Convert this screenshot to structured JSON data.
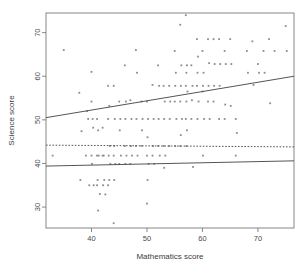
{
  "chart_data": {
    "type": "scatter",
    "title": "",
    "xlabel": "Mathematics score",
    "ylabel": "Science score",
    "xlim": [
      31.8,
      76.5
    ],
    "ylim": [
      25.2,
      74.5
    ],
    "xticks": [
      40,
      50,
      60,
      70
    ],
    "yticks": [
      30,
      40,
      50,
      60,
      70
    ],
    "grid": false,
    "legend": "none",
    "point_color": "#8c8c8c",
    "line_color": "#555555",
    "frame_color": "#7a7a7a",
    "points": [
      [
        35.0,
        66.0
      ],
      [
        33.0,
        41.8
      ],
      [
        37.8,
        56.2
      ],
      [
        38.2,
        47.4
      ],
      [
        38.0,
        36.2
      ],
      [
        39.0,
        41.8
      ],
      [
        39.4,
        50.2
      ],
      [
        39.2,
        52.0
      ],
      [
        39.6,
        35.0
      ],
      [
        40.0,
        61.0
      ],
      [
        40.2,
        50.2
      ],
      [
        40.3,
        48.2
      ],
      [
        40.0,
        41.8
      ],
      [
        40.1,
        39.9
      ],
      [
        40.4,
        35.0
      ],
      [
        40.0,
        54.2
      ],
      [
        41.0,
        50.2
      ],
      [
        41.2,
        47.6
      ],
      [
        41.0,
        41.8
      ],
      [
        41.3,
        41.8
      ],
      [
        41.1,
        36.2
      ],
      [
        41.0,
        35.0
      ],
      [
        41.2,
        29.2
      ],
      [
        41.5,
        33.0
      ],
      [
        42.0,
        48.2
      ],
      [
        42.2,
        41.8
      ],
      [
        42.0,
        41.8
      ],
      [
        42.3,
        36.2
      ],
      [
        42.1,
        35.0
      ],
      [
        42.5,
        32.9
      ],
      [
        43.0,
        57.8
      ],
      [
        43.2,
        53.2
      ],
      [
        43.0,
        50.2
      ],
      [
        43.3,
        44.0
      ],
      [
        43.1,
        41.8
      ],
      [
        43.4,
        39.9
      ],
      [
        43.2,
        36.2
      ],
      [
        43.0,
        35.0
      ],
      [
        44.0,
        57.8
      ],
      [
        44.2,
        50.2
      ],
      [
        44.1,
        44.0
      ],
      [
        44.0,
        41.8
      ],
      [
        44.3,
        39.9
      ],
      [
        44.1,
        36.2
      ],
      [
        44.0,
        26.3
      ],
      [
        45.0,
        54.2
      ],
      [
        45.2,
        50.2
      ],
      [
        45.1,
        47.6
      ],
      [
        45.3,
        41.8
      ],
      [
        45.0,
        39.9
      ],
      [
        46.0,
        62.5
      ],
      [
        46.2,
        54.2
      ],
      [
        46.1,
        50.2
      ],
      [
        46.0,
        44.0
      ],
      [
        46.3,
        41.8
      ],
      [
        46.1,
        39.9
      ],
      [
        47.0,
        54.5
      ],
      [
        47.2,
        50.2
      ],
      [
        47.1,
        44.0
      ],
      [
        47.3,
        41.8
      ],
      [
        47.0,
        39.9
      ],
      [
        48.0,
        66.0
      ],
      [
        48.2,
        60.8
      ],
      [
        48.1,
        50.2
      ],
      [
        48.0,
        44.0
      ],
      [
        48.3,
        41.8
      ],
      [
        49.0,
        54.2
      ],
      [
        49.2,
        50.2
      ],
      [
        49.1,
        47.6
      ],
      [
        49.0,
        44.0
      ],
      [
        50.0,
        54.2
      ],
      [
        50.2,
        50.2
      ],
      [
        50.1,
        46.0
      ],
      [
        50.0,
        41.8
      ],
      [
        50.3,
        39.9
      ],
      [
        50.1,
        36.2
      ],
      [
        50.0,
        30.8
      ],
      [
        51.0,
        58.0
      ],
      [
        51.2,
        50.2
      ],
      [
        51.1,
        44.0
      ],
      [
        51.0,
        41.8
      ],
      [
        51.3,
        39.9
      ],
      [
        52.0,
        62.5
      ],
      [
        52.2,
        57.8
      ],
      [
        52.1,
        50.2
      ],
      [
        52.0,
        44.0
      ],
      [
        52.3,
        41.8
      ],
      [
        53.0,
        57.8
      ],
      [
        53.2,
        54.2
      ],
      [
        53.1,
        50.2
      ],
      [
        53.0,
        44.0
      ],
      [
        53.3,
        41.8
      ],
      [
        53.1,
        39.0
      ],
      [
        54.0,
        57.8
      ],
      [
        54.2,
        54.2
      ],
      [
        54.1,
        50.2
      ],
      [
        54.0,
        44.0
      ],
      [
        55.0,
        65.8
      ],
      [
        55.2,
        60.8
      ],
      [
        55.1,
        57.8
      ],
      [
        55.0,
        54.2
      ],
      [
        55.3,
        50.2
      ],
      [
        55.1,
        44.0
      ],
      [
        56.0,
        71.8
      ],
      [
        56.2,
        62.5
      ],
      [
        56.1,
        57.8
      ],
      [
        56.0,
        54.2
      ],
      [
        56.3,
        50.2
      ],
      [
        56.1,
        46.5
      ],
      [
        56.0,
        44.0
      ],
      [
        57.0,
        74.0
      ],
      [
        57.2,
        62.5
      ],
      [
        57.1,
        60.8
      ],
      [
        57.0,
        57.8
      ],
      [
        57.3,
        56.5
      ],
      [
        57.1,
        54.2
      ],
      [
        57.0,
        50.2
      ],
      [
        57.2,
        47.6
      ],
      [
        57.1,
        44.0
      ],
      [
        58.0,
        62.5
      ],
      [
        58.2,
        57.8
      ],
      [
        58.1,
        54.5
      ],
      [
        58.0,
        50.2
      ],
      [
        58.3,
        39.2
      ],
      [
        59.0,
        68.5
      ],
      [
        59.2,
        64.5
      ],
      [
        59.1,
        60.8
      ],
      [
        59.0,
        57.8
      ],
      [
        59.3,
        54.2
      ],
      [
        59.1,
        50.2
      ],
      [
        60.0,
        65.8
      ],
      [
        60.2,
        60.8
      ],
      [
        60.1,
        57.8
      ],
      [
        60.0,
        56.5
      ],
      [
        60.3,
        50.2
      ],
      [
        60.1,
        41.8
      ],
      [
        61.0,
        68.5
      ],
      [
        61.2,
        63.0
      ],
      [
        61.1,
        57.8
      ],
      [
        61.0,
        54.2
      ],
      [
        61.3,
        50.2
      ],
      [
        62.0,
        68.5
      ],
      [
        62.2,
        62.8
      ],
      [
        62.1,
        57.8
      ],
      [
        62.0,
        54.2
      ],
      [
        63.0,
        68.5
      ],
      [
        63.2,
        62.8
      ],
      [
        63.1,
        57.8
      ],
      [
        63.0,
        50.2
      ],
      [
        64.0,
        65.8
      ],
      [
        64.2,
        62.8
      ],
      [
        64.1,
        53.5
      ],
      [
        64.0,
        50.2
      ],
      [
        65.0,
        68.5
      ],
      [
        65.2,
        62.8
      ],
      [
        65.1,
        53.2
      ],
      [
        66.0,
        50.2
      ],
      [
        66.2,
        47.0
      ],
      [
        66.0,
        41.8
      ],
      [
        68.0,
        65.8
      ],
      [
        68.2,
        60.8
      ],
      [
        69.0,
        68.0
      ],
      [
        69.2,
        58.0
      ],
      [
        70.0,
        62.8
      ],
      [
        70.2,
        60.8
      ],
      [
        71.0,
        65.8
      ],
      [
        71.2,
        60.8
      ],
      [
        72.0,
        68.5
      ],
      [
        72.2,
        53.8
      ],
      [
        73.0,
        65.8
      ],
      [
        75.0,
        71.5
      ],
      [
        75.2,
        65.8
      ]
    ],
    "lines": [
      {
        "name": "upper-regression-line",
        "style": "solid",
        "x0": 31.8,
        "y0": 50.5,
        "x1": 76.5,
        "y1": 60.0
      },
      {
        "name": "reference-dashed-line",
        "style": "dashed",
        "x0": 31.8,
        "y0": 44.2,
        "x1": 76.5,
        "y1": 43.8
      },
      {
        "name": "lower-regression-line",
        "style": "solid",
        "x0": 31.8,
        "y0": 39.4,
        "x1": 76.5,
        "y1": 40.6
      }
    ]
  }
}
